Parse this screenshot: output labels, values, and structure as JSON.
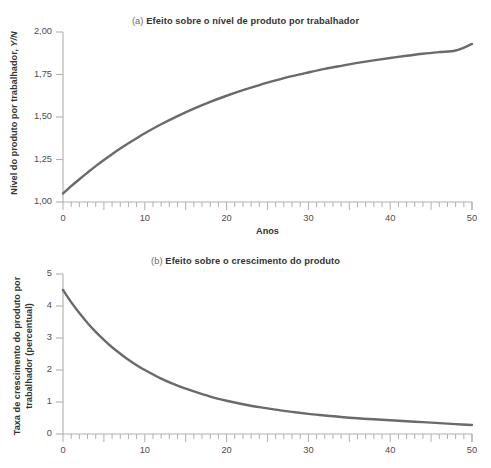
{
  "figure": {
    "background": "#ffffff",
    "curve_color": "#6a6a6a",
    "axis_color": "#b0b0b0",
    "text_color": "#3b3b3b"
  },
  "panel_a": {
    "tag": "(a)",
    "title": "Efeito sobre o nível de produto por trabalhador",
    "ylabel_main": "Nível do produto por trabalhador, ",
    "ylabel_symbol": "Y/N",
    "xlabel": "Anos",
    "ytick_labels": [
      "1,00",
      "1,25",
      "1,50",
      "1,75",
      "2,00"
    ],
    "xtick_labels": [
      "0",
      "10",
      "20",
      "30",
      "40",
      "50"
    ]
  },
  "panel_b": {
    "tag": "(b)",
    "title": "Efeito sobre o crescimento do produto",
    "ylabel_line1": "Taxa de crescimento do produto por",
    "ylabel_line2": "trabalhador (percentual)",
    "xlabel": "",
    "ytick_labels": [
      "0",
      "1",
      "2",
      "3",
      "4",
      "5"
    ],
    "xtick_labels": [
      "0",
      "10",
      "20",
      "30",
      "40",
      "50"
    ]
  },
  "chart_data": [
    {
      "type": "line",
      "panel": "(a)",
      "title": "(a) Efeito sobre o nível de produto por trabalhador",
      "xlabel": "Anos",
      "ylabel": "Nível do produto por trabalhador, Y/N",
      "xlim": [
        0,
        50
      ],
      "ylim": [
        1.0,
        2.0
      ],
      "ytick_values": [
        1.0,
        1.25,
        1.5,
        1.75,
        2.0
      ],
      "xtick_values": [
        0,
        10,
        20,
        30,
        40,
        50
      ],
      "minor_tick_interval": 1,
      "grid": false,
      "legend": "none",
      "series": [
        {
          "name": "Nível de produto por trabalhador",
          "color": "#6a6a6a",
          "x": [
            0,
            1,
            2,
            3,
            4,
            5,
            6,
            7,
            8,
            9,
            10,
            12,
            14,
            16,
            18,
            20,
            22,
            24,
            26,
            28,
            30,
            32,
            34,
            36,
            38,
            40,
            42,
            44,
            46,
            48,
            50
          ],
          "values": [
            1.05,
            1.093,
            1.134,
            1.173,
            1.211,
            1.247,
            1.281,
            1.314,
            1.345,
            1.375,
            1.404,
            1.457,
            1.505,
            1.549,
            1.589,
            1.625,
            1.658,
            1.688,
            1.715,
            1.74,
            1.762,
            1.783,
            1.801,
            1.818,
            1.833,
            1.847,
            1.86,
            1.872,
            1.882,
            1.891,
            1.93
          ]
        }
      ]
    },
    {
      "type": "line",
      "panel": "(b)",
      "title": "(b) Efeito sobre o crescimento do produto",
      "xlabel": "",
      "ylabel": "Taxa de crescimento do produto por trabalhador (percentual)",
      "xlim": [
        0,
        50
      ],
      "ylim": [
        0,
        5
      ],
      "ytick_values": [
        0,
        1,
        2,
        3,
        4,
        5
      ],
      "xtick_values": [
        0,
        10,
        20,
        30,
        40,
        50
      ],
      "minor_tick_interval": 1,
      "grid": false,
      "legend": "none",
      "series": [
        {
          "name": "Taxa de crescimento do produto por trabalhador",
          "color": "#6a6a6a",
          "x": [
            0,
            1,
            2,
            3,
            4,
            5,
            6,
            7,
            8,
            9,
            10,
            12,
            14,
            16,
            18,
            20,
            22,
            24,
            26,
            28,
            30,
            32,
            34,
            36,
            38,
            40,
            42,
            44,
            46,
            48,
            50
          ],
          "values": [
            4.5,
            4.12,
            3.78,
            3.47,
            3.19,
            2.94,
            2.71,
            2.51,
            2.32,
            2.15,
            2.0,
            1.73,
            1.51,
            1.33,
            1.17,
            1.04,
            0.93,
            0.84,
            0.76,
            0.69,
            0.63,
            0.58,
            0.53,
            0.49,
            0.46,
            0.43,
            0.4,
            0.37,
            0.34,
            0.31,
            0.28
          ]
        }
      ]
    }
  ]
}
